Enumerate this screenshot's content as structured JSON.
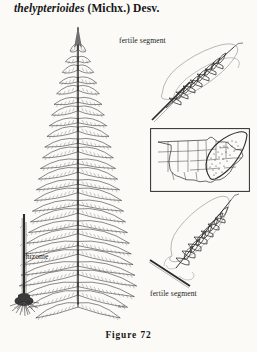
{
  "heading": {
    "epithet": "thelypterioides",
    "authority": "(Michx.) Desv."
  },
  "labels": {
    "fertile_segment_top": "fertile segment",
    "fertile_segment_bottom": "fertile segment",
    "rhizome": "rhizome"
  },
  "caption": "Figure 72",
  "signature": "K.H.",
  "illustration": {
    "main_subject": "fern-frond-pinnate",
    "parts": [
      "sterile-frond-blade",
      "rhizome-with-roots",
      "fertile-segment-detail-upper",
      "fertile-segment-detail-lower",
      "distribution-map-inset"
    ]
  },
  "map": {
    "region": "united-states",
    "range_shading": "eastern-north-america-stippled"
  },
  "colors": {
    "page_background": "#fbfaf7",
    "ink": "#2b2b2b",
    "ink_soft": "#6d6d6d",
    "ink_pale": "#9a9a9a"
  }
}
